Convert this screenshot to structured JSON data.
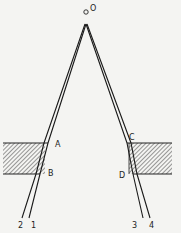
{
  "diagram": {
    "type": "optics-ray-refraction",
    "source": {
      "label": "O",
      "x": 86,
      "y": 11
    },
    "apex": {
      "x": 86,
      "y": 24
    },
    "left_slab": {
      "x": 3,
      "y": 143,
      "width": 42,
      "height": 31,
      "points": {
        "top": "A",
        "bottom": "B"
      }
    },
    "right_slab": {
      "x": 129,
      "y": 143,
      "width": 43,
      "height": 31,
      "points": {
        "top": "C",
        "bottom": "D"
      }
    },
    "rays": [
      {
        "label": "1",
        "end_x": 29,
        "end_y": 218
      },
      {
        "label": "2",
        "end_x": 22,
        "end_y": 218
      },
      {
        "label": "3",
        "end_x": 143,
        "end_y": 218
      },
      {
        "label": "4",
        "end_x": 150,
        "end_y": 218
      }
    ],
    "labels": {
      "O": "O",
      "A": "A",
      "B": "B",
      "C": "C",
      "D": "D",
      "ray1": "1",
      "ray2": "2",
      "ray3": "3",
      "ray4": "4"
    },
    "colors": {
      "line": "#1a1a1a",
      "hatch": "#555555",
      "background": "#f4f4f2"
    }
  }
}
